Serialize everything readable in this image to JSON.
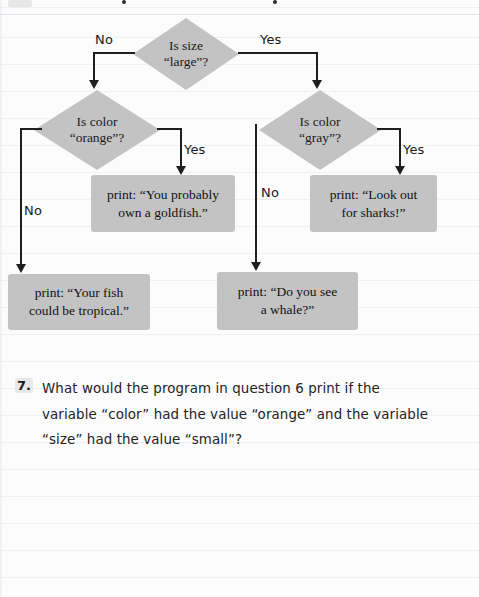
{
  "page": {
    "background_color": "#fcfcfc",
    "rule_line_color": "#cdd4de",
    "shape_fill_color": "#c3c3c3",
    "line_color": "#1f1f1f"
  },
  "flowchart": {
    "decisions": [
      {
        "name": "is-size-large",
        "line1": "Is size",
        "line2": "“large”?"
      },
      {
        "name": "is-color-orange",
        "line1": "Is color",
        "line2": "“orange”?"
      },
      {
        "name": "is-color-gray",
        "line1": "Is color",
        "line2": "“gray”?"
      }
    ],
    "outputs": [
      {
        "name": "print-goldfish",
        "line1": "print: “You probably",
        "line2": "own a goldfish.”"
      },
      {
        "name": "print-sharks",
        "line1": "print: “Look out",
        "line2": "for sharks!”"
      },
      {
        "name": "print-tropical",
        "line1": "print: “Your fish",
        "line2": "could be tropical.”"
      },
      {
        "name": "print-whale",
        "line1": "print: “Do you see",
        "line2": "a whale?”"
      }
    ],
    "edge_labels": {
      "size_no": "No",
      "size_yes": "Yes",
      "orange_yes": "Yes",
      "orange_no": "No",
      "gray_yes": "Yes",
      "gray_no": "No"
    }
  },
  "question": {
    "number": "7.",
    "line1": "What would the program in question 6 print if the",
    "line2": "variable “color” had the value “orange” and the variable",
    "line3": "“size” had the value “small”?"
  }
}
